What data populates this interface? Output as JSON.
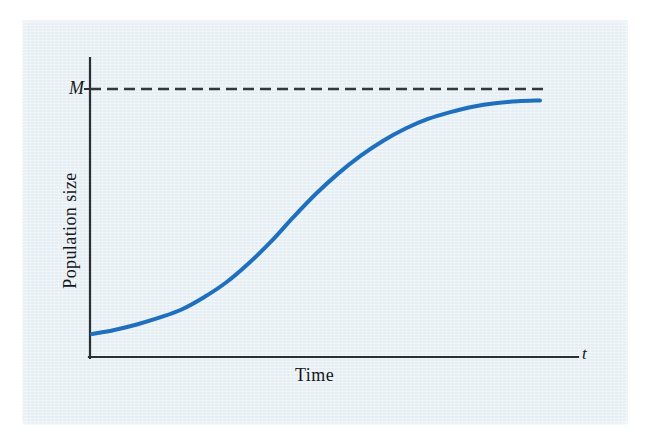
{
  "figure": {
    "background_color": "#ffffff",
    "panel_color": "#e5eef3",
    "curve_color": "#1f6fbf",
    "axis_color": "#2b2f33",
    "text_color": "#15171a"
  },
  "labels": {
    "y_axis": "Population size",
    "x_axis": "Time",
    "x_variable": "t",
    "carrying_capacity": "M"
  },
  "chart_data": {
    "type": "line",
    "title": "",
    "subtitle": "",
    "xlabel": "Time",
    "ylabel": "Population size",
    "grid": false,
    "legend_position": "none",
    "xlim": [
      0,
      100
    ],
    "ylim": [
      0,
      1.05
    ],
    "annotations": [
      {
        "text": "M",
        "kind": "horizontal-asymptote",
        "y": 1.0,
        "style": "dashed",
        "color": "#2b2f33",
        "note": "carrying capacity asymptote labelled M on the y-axis"
      },
      {
        "text": "t",
        "kind": "axis-variable",
        "position": "x-axis-end",
        "color": "#15171a"
      }
    ],
    "series": [
      {
        "name": "Logistic growth",
        "color": "#1f6fbf",
        "line_width": 4,
        "x": [
          0,
          5,
          10,
          15,
          20,
          25,
          30,
          35,
          40,
          45,
          50,
          55,
          60,
          65,
          70,
          75,
          80,
          85,
          90,
          95,
          100
        ],
        "y": [
          0.1,
          0.115,
          0.135,
          0.16,
          0.19,
          0.235,
          0.29,
          0.36,
          0.44,
          0.53,
          0.615,
          0.69,
          0.755,
          0.81,
          0.855,
          0.89,
          0.915,
          0.935,
          0.948,
          0.955,
          0.958
        ]
      }
    ]
  },
  "geometry": {
    "panel": {
      "x": 22,
      "y": 20,
      "w": 606,
      "h": 405
    },
    "y_axis_x": 90,
    "y_axis_top": 58,
    "x_axis_y": 357,
    "x_axis_right": 578,
    "asymptote_y": 89,
    "asymptote_x_end": 548,
    "curve_start": {
      "x": 92,
      "y": 334
    },
    "curve_inflection": {
      "x": 305,
      "y": 212
    },
    "curve_end": {
      "x": 540,
      "y": 100
    }
  }
}
